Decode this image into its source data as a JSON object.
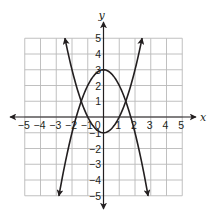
{
  "chart_data": {
    "type": "line",
    "title": "",
    "xlabel": "x",
    "ylabel": "y",
    "xlim": [
      -5,
      5
    ],
    "ylim": [
      -5,
      5
    ],
    "grid": true,
    "x_ticks": [
      -5,
      -4,
      -3,
      -2,
      -1,
      0,
      1,
      2,
      3,
      4,
      5
    ],
    "x_tick_labels": [
      "−5",
      "−4",
      "−3",
      "−2",
      "−1",
      "0",
      "1",
      "2",
      "3",
      "4",
      "5"
    ],
    "y_ticks": [
      -5,
      -4,
      -3,
      -2,
      -1,
      1,
      2,
      3,
      4,
      5
    ],
    "y_tick_labels": [
      "−5",
      "−4",
      "−3",
      "−2",
      "−1",
      "1",
      "2",
      "3",
      "4",
      "5"
    ],
    "origin_label": "0",
    "series": [
      {
        "name": "upward parabola",
        "equation": "y = x^2 - 1",
        "vertex": [
          0,
          -1
        ],
        "x": [
          -2.45,
          -2,
          -1.5,
          -1,
          -0.5,
          0,
          0.5,
          1,
          1.5,
          2,
          2.45
        ],
        "y": [
          5.0,
          3.0,
          1.25,
          0,
          -0.75,
          -1,
          -0.75,
          0,
          1.25,
          3.0,
          5.0
        ],
        "arrows_at_ends": true
      },
      {
        "name": "downward parabola",
        "equation": "y = 3 - x^2",
        "vertex": [
          0,
          3
        ],
        "x": [
          -2.83,
          -2.5,
          -2,
          -1.5,
          -1,
          -0.5,
          0,
          0.5,
          1,
          1.5,
          2,
          2.5,
          2.83
        ],
        "y": [
          -5.0,
          -3.25,
          -1,
          0.75,
          2,
          2.75,
          3,
          2.75,
          2,
          0.75,
          -1,
          -3.25,
          -5.0
        ],
        "arrows_at_ends": true
      }
    ],
    "intersections": [
      [
        -1.41,
        1
      ],
      [
        1.41,
        1
      ]
    ],
    "colors": {
      "curves": "#231f20",
      "axes": "#231f20",
      "grid": "#b9b9b9",
      "background": "#ffffff"
    }
  }
}
